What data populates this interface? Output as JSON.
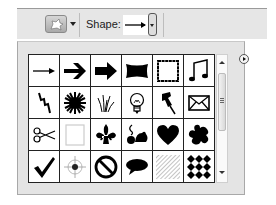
{
  "toolbar": {
    "preset_tool_icon": "custom-shape-tool-icon",
    "shape_label": "Shape:",
    "selected_shape": "arrow-thin"
  },
  "picker": {
    "columns": 6,
    "rows_visible": 4,
    "shapes": [
      {
        "name": "arrow-thin"
      },
      {
        "name": "arrow-bold"
      },
      {
        "name": "arrow-block"
      },
      {
        "name": "banner"
      },
      {
        "name": "frame-square"
      },
      {
        "name": "music-notes"
      },
      {
        "name": "lightning-bolt"
      },
      {
        "name": "starburst"
      },
      {
        "name": "grass"
      },
      {
        "name": "light-bulb"
      },
      {
        "name": "thumbtack"
      },
      {
        "name": "envelope"
      },
      {
        "name": "scissors"
      },
      {
        "name": "blank-frame"
      },
      {
        "name": "fleur-de-lis"
      },
      {
        "name": "ornament-bird"
      },
      {
        "name": "heart"
      },
      {
        "name": "puzzle-blob"
      },
      {
        "name": "checkmark"
      },
      {
        "name": "target-crosshair"
      },
      {
        "name": "no-symbol"
      },
      {
        "name": "speech-bubble"
      },
      {
        "name": "hatch-pattern"
      },
      {
        "name": "diamond-pattern"
      }
    ]
  },
  "menu_button": {
    "icon": "panel-menu-icon"
  }
}
